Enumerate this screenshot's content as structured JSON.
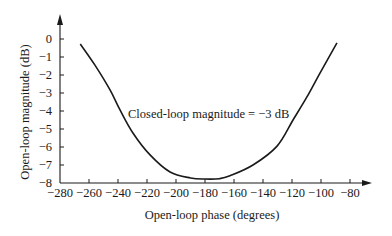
{
  "chart_data": {
    "type": "line",
    "title": "",
    "xlabel": "Open-loop phase (degrees)",
    "ylabel": "Open-loop magnitude (dB)",
    "xlim": [
      -280,
      -75
    ],
    "ylim": [
      -8,
      0.8
    ],
    "xticks": [
      -280,
      -260,
      -240,
      -220,
      -200,
      -180,
      -160,
      -140,
      -120,
      -100,
      -80
    ],
    "xtick_labels": [
      "−280",
      "−260",
      "−240",
      "−220",
      "−200",
      "−180",
      "−160",
      "−140",
      "−120",
      "−100",
      "−80"
    ],
    "yticks": [
      0,
      -1,
      -2,
      -3,
      -4,
      -5,
      -6,
      -7,
      -8
    ],
    "ytick_labels": [
      "0",
      "−1",
      "−2",
      "−3",
      "−4",
      "−5",
      "−6",
      "−7",
      "−8"
    ],
    "grid": false,
    "legend": null,
    "annotations": [
      {
        "text": "Closed-loop magnitude = −3 dB",
        "x": -232,
        "y": -4.3
      }
    ],
    "series": [
      {
        "name": "Closed-loop magnitude = -3 dB contour",
        "color": "#1a1a1a",
        "x": [
          -266,
          -256,
          -245.5,
          -238.6,
          -229.7,
          -217.9,
          -204.1,
          -190,
          -180,
          -170,
          -162.8,
          -146.9,
          -130.3,
          -119.3,
          -109.7,
          -100.7,
          -89
        ],
        "y": [
          -0.28,
          -1.44,
          -2.83,
          -3.94,
          -5.22,
          -6.44,
          -7.39,
          -7.72,
          -7.78,
          -7.76,
          -7.6,
          -7.0,
          -5.95,
          -4.5,
          -3.22,
          -1.89,
          -0.22
        ]
      }
    ]
  },
  "colors": {
    "background": "#ffffff",
    "ink": "#1a1a1a"
  }
}
